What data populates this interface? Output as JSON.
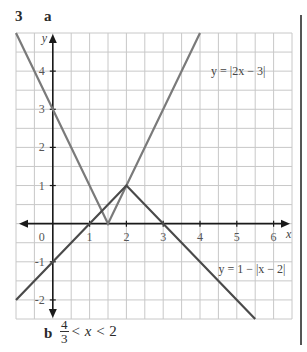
{
  "question": {
    "number": "3",
    "part_a_label": "a",
    "part_b_label": "b",
    "answer_b": {
      "fraction_numerator": "4",
      "fraction_denominator": "3",
      "inequality_middle": " < ",
      "variable": "x",
      "inequality_right": " < 2"
    }
  },
  "colors": {
    "grid": "#c8c8c8",
    "axis": "#1a1a1a",
    "curve_abs": "#7a7a7a",
    "curve_neg_abs": "#4a4a4a"
  },
  "chart_data": {
    "type": "line",
    "title": "",
    "xlabel": "x",
    "ylabel": "y",
    "xlim": [
      -1,
      6.5
    ],
    "ylim": [
      -2.5,
      5
    ],
    "grid": true,
    "grid_step": 0.5,
    "x_ticks": [
      {
        "value": 0,
        "label": "0"
      },
      {
        "value": 1,
        "label": "1"
      },
      {
        "value": 2,
        "label": "2"
      },
      {
        "value": 3,
        "label": "3"
      },
      {
        "value": 4,
        "label": "4"
      },
      {
        "value": 5,
        "label": "5"
      },
      {
        "value": 6,
        "label": "6"
      }
    ],
    "y_ticks": [
      {
        "value": 4,
        "label": "4"
      },
      {
        "value": 3,
        "label": "3"
      },
      {
        "value": 2,
        "label": "2"
      },
      {
        "value": 1,
        "label": "1"
      },
      {
        "value": -1,
        "label": "-1"
      },
      {
        "value": -2,
        "label": "-2"
      }
    ],
    "series": [
      {
        "name": "y = |2x − 3|",
        "points": [
          [
            -1,
            5
          ],
          [
            1.5,
            0
          ],
          [
            4,
            5
          ]
        ],
        "label_position": [
          4.3,
          3.9
        ]
      },
      {
        "name": "y = 1 − |x − 2|",
        "points": [
          [
            -1,
            -2
          ],
          [
            2,
            1
          ],
          [
            5.5,
            -2.5
          ]
        ],
        "label_position": [
          4.5,
          -1.3
        ]
      }
    ],
    "legend_position": "inline labels"
  }
}
